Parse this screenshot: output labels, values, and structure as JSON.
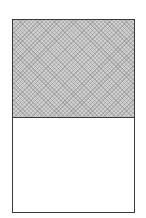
{
  "diagram": {
    "regions": [
      {
        "name": "top",
        "fill": "dotted-gray",
        "fraction": 0.5
      },
      {
        "name": "bottom",
        "fill": "white",
        "fraction": 0.5
      }
    ],
    "colors": {
      "border": "#3a3a3a",
      "shade": "#c8c8c8",
      "background": "#ffffff"
    }
  }
}
